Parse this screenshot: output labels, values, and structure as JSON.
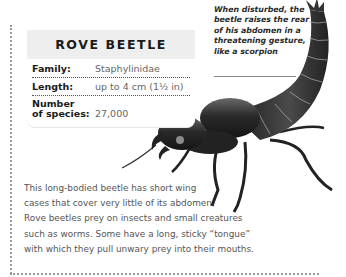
{
  "factbox": {
    "title": "ROVE BEETLE",
    "rows": [
      {
        "label": "Family:",
        "value": "Staphylinidae"
      },
      {
        "label": "Length:",
        "value": "up to 4 cm (1½ in)"
      },
      {
        "label_line1": "Number",
        "label_line2": "of species:",
        "value": "27,000"
      }
    ]
  },
  "caption": {
    "lines": [
      "When disturbed, the",
      "beetle raises the rear",
      "of his abdomen in a",
      "threatening gesture,",
      "like a scorpion"
    ]
  },
  "description": {
    "lines": [
      "This long-bodied beetle has short wing",
      "cases that cover very little of its abdomen.",
      "Rove beetles prey on insects and small creatures",
      "such as worms. Some have a long, sticky “tongue”",
      "with which they pull unwary prey into their mouths."
    ]
  },
  "illustration": {
    "subject": "rove-beetle-illustration",
    "colors": {
      "body": "#2b2b2b",
      "highlight": "#8c8c8c",
      "segment": "#bdbdbd"
    }
  }
}
